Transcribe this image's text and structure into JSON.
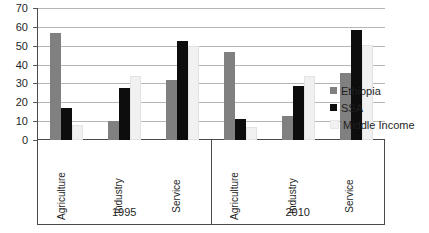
{
  "chart_data": {
    "type": "bar",
    "title": "",
    "subtitle": "",
    "xlabel": "",
    "ylabel": "",
    "ylim": [
      0,
      70
    ],
    "yticks": [
      0,
      10,
      20,
      30,
      40,
      50,
      60,
      70
    ],
    "grid": true,
    "legend_position": "right",
    "group_labels": [
      "1995",
      "2010"
    ],
    "categories": [
      "Agriculture",
      "Industry",
      "Service",
      "Agriculture",
      "Industry",
      "Service"
    ],
    "series": [
      {
        "name": "Ethiopia",
        "color": "#808080",
        "values": [
          57,
          10,
          32,
          47,
          13,
          36
        ]
      },
      {
        "name": "SSA",
        "color": "#0d0d0d",
        "values": [
          17,
          28,
          53,
          11,
          29,
          59
        ]
      },
      {
        "name": "Middle Income",
        "color": "#f1f1f1",
        "values": [
          8,
          34,
          50,
          7,
          34,
          51
        ]
      }
    ],
    "groups": [
      {
        "year": "1995",
        "categories": [
          {
            "label": "Agriculture",
            "ethiopia": 57,
            "ssa": 17,
            "middle_income": 8
          },
          {
            "label": "Industry",
            "ethiopia": 10,
            "ssa": 28,
            "middle_income": 34
          },
          {
            "label": "Service",
            "ethiopia": 32,
            "ssa": 53,
            "middle_income": 50
          }
        ]
      },
      {
        "year": "2010",
        "categories": [
          {
            "label": "Agriculture",
            "ethiopia": 47,
            "ssa": 11,
            "middle_income": 7
          },
          {
            "label": "Industry",
            "ethiopia": 13,
            "ssa": 29,
            "middle_income": 34
          },
          {
            "label": "Service",
            "ethiopia": 36,
            "ssa": 59,
            "middle_income": 51
          }
        ]
      }
    ]
  },
  "axis": {
    "y_tick_labels": [
      "70",
      "60",
      "50",
      "40",
      "30",
      "20",
      "10",
      "0"
    ]
  },
  "legend": {
    "items": [
      {
        "label": "Ethiopia",
        "swatch": "series-ethiopia"
      },
      {
        "label": "SSA",
        "swatch": "series-ssa"
      },
      {
        "label": "Middle Income",
        "swatch": "series-middle"
      }
    ]
  }
}
